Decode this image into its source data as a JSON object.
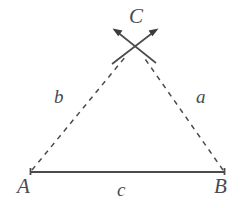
{
  "figure": {
    "background_color": "#ffffff",
    "stroke_color": "#4a4a4f",
    "vertices": [
      {
        "id": "A",
        "label": "A",
        "x": 30,
        "y": 172
      },
      {
        "id": "B",
        "label": "B",
        "x": 225,
        "y": 172
      },
      {
        "id": "C",
        "label": "C",
        "x": 134,
        "y": 44
      }
    ],
    "sides": [
      {
        "id": "a",
        "label": "a",
        "from": "B",
        "to": "C",
        "style": "dashed",
        "label_x": 196,
        "label_y": 87
      },
      {
        "id": "b",
        "label": "b",
        "from": "A",
        "to": "C",
        "style": "dashed",
        "label_x": 54,
        "label_y": 87
      },
      {
        "id": "c",
        "label": "c",
        "from": "A",
        "to": "B",
        "style": "solid",
        "label_x": 117,
        "label_y": 180
      }
    ],
    "base_segment": {
      "x1": 30,
      "y1": 172,
      "x2": 225,
      "y2": 172,
      "stroke_width": 2.2,
      "end_ticks": true,
      "tick_height": 7
    },
    "construction_arcs": [
      {
        "id": "arc-from-A",
        "x1": 112,
        "y1": 64,
        "x2": 157,
        "y2": 30,
        "arrow_at": "end"
      },
      {
        "id": "arc-from-B",
        "x1": 156,
        "y1": 63,
        "x2": 113,
        "y2": 30,
        "arrow_at": "end"
      }
    ],
    "dash_pattern": "5 5",
    "dash_stroke_width": 1.5,
    "arc_stroke_width": 1.7
  }
}
